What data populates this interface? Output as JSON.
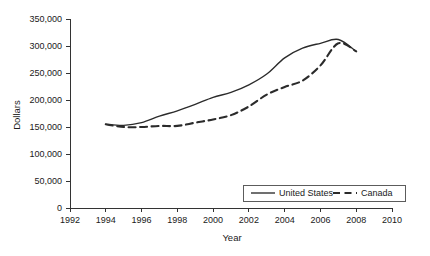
{
  "chart_data": {
    "type": "line",
    "title": "",
    "xlabel": "Year",
    "ylabel": "Dollars",
    "xlim": [
      1992,
      2010
    ],
    "ylim": [
      0,
      350000
    ],
    "xticks": [
      1992,
      1994,
      1996,
      1998,
      2000,
      2002,
      2004,
      2006,
      2008,
      2010
    ],
    "xtick_labels": [
      "1992",
      "1994",
      "1996",
      "1998",
      "2000",
      "2002",
      "2004",
      "2006",
      "2008",
      "2010"
    ],
    "yticks": [
      0,
      50000,
      100000,
      150000,
      200000,
      250000,
      300000,
      350000
    ],
    "ytick_labels": [
      "0",
      "50,000",
      "100,000",
      "150,000",
      "200,000",
      "250,000",
      "300,000",
      "350,000"
    ],
    "grid": false,
    "legend_position": "lower-right",
    "x": [
      1994,
      1995,
      1996,
      1997,
      1998,
      1999,
      2000,
      2001,
      2002,
      2003,
      2004,
      2005,
      2006,
      2007,
      2008
    ],
    "series": [
      {
        "name": "United States",
        "style": "solid",
        "color": "#2b2b2b",
        "values": [
          155000,
          153000,
          158000,
          170000,
          180000,
          192000,
          205000,
          214000,
          228000,
          248000,
          278000,
          296000,
          305000,
          312000,
          290000
        ]
      },
      {
        "name": "Canada",
        "style": "dashed",
        "color": "#2b2b2b",
        "values": [
          155000,
          150000,
          150000,
          152000,
          152000,
          158000,
          164000,
          172000,
          188000,
          210000,
          224000,
          236000,
          264000,
          305000,
          290000
        ]
      }
    ]
  },
  "legend": {
    "entries": [
      {
        "label": "United States",
        "style": "solid"
      },
      {
        "label": "Canada",
        "style": "dashed"
      }
    ]
  },
  "axes": {
    "y_title": "Dollars",
    "x_title": "Year"
  }
}
